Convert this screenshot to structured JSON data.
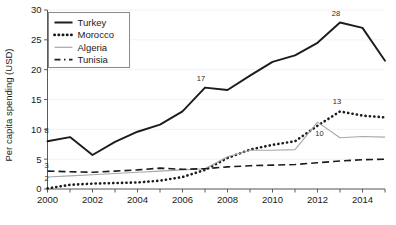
{
  "chart_data": {
    "type": "line",
    "title": "",
    "xlabel": "",
    "ylabel": "Per capita spending (USD)",
    "xlim": [
      2000,
      2015
    ],
    "ylim": [
      0,
      30
    ],
    "yticks": [
      0,
      5,
      10,
      15,
      20,
      25,
      30
    ],
    "xticks": [
      2000,
      2001,
      2002,
      2003,
      2004,
      2005,
      2006,
      2007,
      2008,
      2009,
      2010,
      2011,
      2012,
      2013,
      2014,
      2015
    ],
    "xtick_labels": [
      "2000",
      "",
      "2002",
      "",
      "2004",
      "",
      "2006",
      "",
      "2008",
      "",
      "2010",
      "",
      "2012",
      "",
      "2014",
      ""
    ],
    "ytick_labels": [
      "0",
      "5",
      "10",
      "15",
      "20",
      "25",
      "30"
    ],
    "grid": true,
    "legend_position": "top-left",
    "x": [
      2000,
      2001,
      2002,
      2003,
      2004,
      2005,
      2006,
      2007,
      2008,
      2009,
      2010,
      2011,
      2012,
      2013,
      2014,
      2015
    ],
    "series": [
      {
        "name": "Turkey",
        "style": "solid",
        "color": "#1c1c1c",
        "values": [
          8.0,
          8.7,
          5.7,
          7.9,
          9.6,
          10.8,
          13.0,
          17.0,
          16.6,
          19.0,
          21.3,
          22.4,
          24.5,
          27.9,
          27.0,
          21.5
        ]
      },
      {
        "name": "Morocco",
        "style": "dotted",
        "color": "#1c1c1c",
        "values": [
          0.1,
          0.7,
          0.9,
          1.0,
          1.1,
          1.4,
          2.0,
          3.2,
          5.2,
          6.6,
          7.4,
          8.0,
          10.6,
          13.0,
          12.3,
          12.0
        ]
      },
      {
        "name": "Algeria",
        "style": "thin-solid",
        "color": "#a8a8a8",
        "values": [
          2.0,
          2.2,
          2.4,
          2.6,
          2.8,
          3.0,
          3.2,
          3.4,
          5.4,
          6.5,
          6.5,
          6.6,
          11.2,
          8.6,
          8.8,
          8.7
        ]
      },
      {
        "name": "Tunisia",
        "style": "dashed",
        "color": "#1c1c1c",
        "values": [
          3.0,
          2.9,
          2.8,
          3.0,
          3.2,
          3.5,
          3.3,
          3.4,
          3.7,
          3.9,
          4.0,
          4.1,
          4.4,
          4.7,
          4.9,
          5.0
        ]
      }
    ],
    "annotations": [
      {
        "text": "8",
        "x": 2000,
        "y": 8.0,
        "dx": -1,
        "dy": -8
      },
      {
        "text": "3",
        "x": 2000,
        "y": 3.0,
        "dx": -1,
        "dy": -3
      },
      {
        "text": "2",
        "x": 2000,
        "y": 2.0,
        "dx": -1,
        "dy": 4
      },
      {
        "text": "17",
        "x": 2007,
        "y": 17.0,
        "dx": -4,
        "dy": -7
      },
      {
        "text": "28",
        "x": 2013,
        "y": 27.9,
        "dx": -4,
        "dy": -7
      },
      {
        "text": "13",
        "x": 2013,
        "y": 13.0,
        "dx": -3,
        "dy": -7
      },
      {
        "text": "10",
        "x": 2012,
        "y": 11.2,
        "dx": 2,
        "dy": 14
      }
    ]
  },
  "legend": {
    "entries": [
      {
        "label": "Turkey"
      },
      {
        "label": "Morocco"
      },
      {
        "label": "Algeria"
      },
      {
        "label": "Tunisia"
      }
    ]
  },
  "axis": {
    "ylabel": "Per capita spending (USD)"
  }
}
